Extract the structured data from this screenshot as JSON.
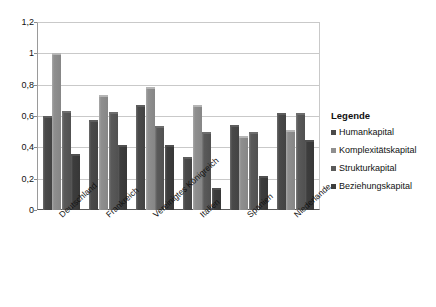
{
  "chart_data": {
    "type": "bar",
    "title": "",
    "subtitle": "",
    "xlabel": "",
    "ylabel": "",
    "ylim": [
      0,
      1.2
    ],
    "ytick_labels": [
      "0",
      "0,2",
      "0,4",
      "0,6",
      "0,8",
      "1",
      "1,2"
    ],
    "ytick_values": [
      0,
      0.2,
      0.4,
      0.6,
      0.8,
      1.0,
      1.2
    ],
    "grid": true,
    "legend_position": "right",
    "legend_title": "Legende",
    "categories": [
      "Deutschland",
      "Frankreich",
      "Vereinigtes Königreich",
      "Italien",
      "Spanien",
      "Niederlande"
    ],
    "series": [
      {
        "name": "Humankapital",
        "color": "#4a4a4a",
        "values": [
          0.6,
          0.575,
          0.67,
          0.34,
          0.545,
          0.62
        ]
      },
      {
        "name": "Komplexitätskapital",
        "color": "#8f8f8f",
        "values": [
          1.0,
          0.735,
          0.785,
          0.67,
          0.475,
          0.51
        ]
      },
      {
        "name": "Strukturkapital",
        "color": "#5a5a5a",
        "values": [
          0.635,
          0.625,
          0.535,
          0.495,
          0.5,
          0.62
        ]
      },
      {
        "name": "Beziehungskapital",
        "color": "#3d3d3d",
        "values": [
          0.355,
          0.415,
          0.415,
          0.14,
          0.215,
          0.45
        ]
      }
    ]
  }
}
